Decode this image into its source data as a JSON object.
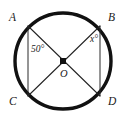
{
  "figure": {
    "type": "circle-geometry-diagram",
    "background_color": "#ffffff",
    "ink_color": "#111111",
    "circle": {
      "center_x": 63,
      "center_y": 61,
      "radius": 48,
      "stroke_width": 3.4
    },
    "center_point": {
      "shape": "filled-square",
      "size": 6,
      "color": "#111111"
    },
    "chord_stroke_width": 1.0
  },
  "points": {
    "A": {
      "label": "A",
      "x": 28,
      "y": 26
    },
    "B": {
      "label": "B",
      "x": 100,
      "y": 26
    },
    "C": {
      "label": "C",
      "x": 28,
      "y": 96
    },
    "D": {
      "label": "D",
      "x": 100,
      "y": 96
    },
    "O": {
      "label": "O",
      "x": 63,
      "y": 61
    }
  },
  "segments": [
    {
      "name": "diameter-AD",
      "from": "A",
      "to": "D"
    },
    {
      "name": "diameter-BC",
      "from": "B",
      "to": "C"
    },
    {
      "name": "chord-AC",
      "from": "A",
      "to": "C"
    },
    {
      "name": "chord-BD",
      "from": "B",
      "to": "D"
    }
  ],
  "angles": {
    "left": {
      "label": "50°",
      "value": 50,
      "vertex": "O",
      "between": "AOC"
    },
    "right": {
      "label": "x°",
      "value": "x",
      "vertex": "O",
      "between": "BOD"
    }
  }
}
